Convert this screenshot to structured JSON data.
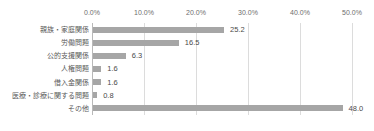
{
  "chart_data": {
    "type": "bar",
    "orientation": "horizontal",
    "title": "",
    "subtitle": "",
    "xlabel": "",
    "ylabel": "",
    "categories": [
      "親族・家庭関係",
      "労働問題",
      "公的支援関係",
      "人権問題",
      "借入金関係",
      "医療・診療に関する問題",
      "その他"
    ],
    "values": [
      25.2,
      16.5,
      6.3,
      1.6,
      1.6,
      0.8,
      48.0
    ],
    "data_labels": [
      "25.2",
      "16.5",
      "6.3",
      "1.6",
      "1.6",
      "0.8",
      "48.0"
    ],
    "xlim": [
      0,
      50
    ],
    "xticks": [
      0,
      10,
      20,
      30,
      40,
      50
    ],
    "xtick_labels": [
      "0.0%",
      "10.0%",
      "20.0%",
      "30.0%",
      "40.0%",
      "50.0%"
    ],
    "grid": true,
    "grid_axis": "x",
    "legend": false,
    "legend_position": "none",
    "bar_color": "#a6a6a6",
    "gridline_color": "#dcdcdc",
    "axis_color": "#b9b9b9",
    "tick_label_color": "#6e6e6e",
    "category_label_color": "#5a5a5a",
    "value_label_color": "#4a4a4a",
    "background_color": "#ffffff"
  }
}
